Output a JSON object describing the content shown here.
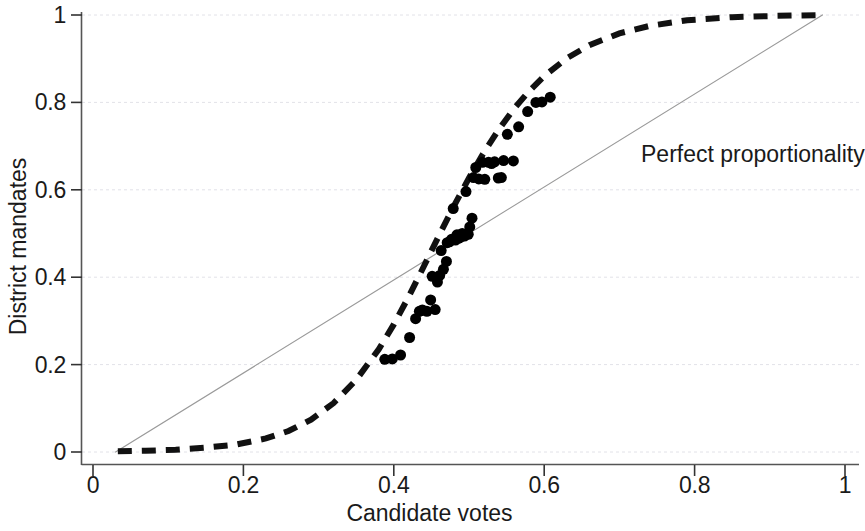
{
  "chart_data": {
    "type": "scatter",
    "title": "",
    "xlabel": "Candidate votes",
    "ylabel": "District mandates",
    "xlim": [
      0,
      1
    ],
    "ylim": [
      0,
      1
    ],
    "grid": true,
    "grid_axis": "y",
    "legend_position": "none",
    "x_ticks": [
      {
        "value": 0,
        "label": "0"
      },
      {
        "value": 0.2,
        "label": "0.2"
      },
      {
        "value": 0.4,
        "label": "0.4"
      },
      {
        "value": 0.6,
        "label": "0.6"
      },
      {
        "value": 0.8,
        "label": "0.8"
      },
      {
        "value": 1,
        "label": "1"
      }
    ],
    "y_ticks": [
      {
        "value": 0,
        "label": "0"
      },
      {
        "value": 0.2,
        "label": "0.2"
      },
      {
        "value": 0.4,
        "label": "0.4"
      },
      {
        "value": 0.6,
        "label": "0.6"
      },
      {
        "value": 0.8,
        "label": "0.8"
      },
      {
        "value": 1,
        "label": "1"
      }
    ],
    "annotations": [
      {
        "text": "Perfect proportionality",
        "x": 0.729,
        "y": 0.676,
        "target_series": "perfect-proportionality-line"
      }
    ],
    "series": [
      {
        "name": "Observed districts",
        "type": "scatter",
        "marker": "filled-circle",
        "color": "#000000",
        "marker_size_px": 11,
        "points": [
          [
            0.388,
            0.212
          ],
          [
            0.398,
            0.213
          ],
          [
            0.409,
            0.222
          ],
          [
            0.421,
            0.262
          ],
          [
            0.429,
            0.305
          ],
          [
            0.434,
            0.322
          ],
          [
            0.438,
            0.325
          ],
          [
            0.444,
            0.322
          ],
          [
            0.449,
            0.348
          ],
          [
            0.451,
            0.402
          ],
          [
            0.455,
            0.326
          ],
          [
            0.458,
            0.389
          ],
          [
            0.461,
            0.404
          ],
          [
            0.463,
            0.461
          ],
          [
            0.466,
            0.418
          ],
          [
            0.47,
            0.436
          ],
          [
            0.471,
            0.479
          ],
          [
            0.474,
            0.481
          ],
          [
            0.477,
            0.487
          ],
          [
            0.479,
            0.557
          ],
          [
            0.482,
            0.485
          ],
          [
            0.484,
            0.497
          ],
          [
            0.486,
            0.489
          ],
          [
            0.489,
            0.492
          ],
          [
            0.491,
            0.5
          ],
          [
            0.494,
            0.494
          ],
          [
            0.496,
            0.596
          ],
          [
            0.499,
            0.498
          ],
          [
            0.501,
            0.515
          ],
          [
            0.504,
            0.535
          ],
          [
            0.506,
            0.628
          ],
          [
            0.509,
            0.651
          ],
          [
            0.513,
            0.625
          ],
          [
            0.518,
            0.663
          ],
          [
            0.521,
            0.624
          ],
          [
            0.526,
            0.663
          ],
          [
            0.53,
            0.66
          ],
          [
            0.534,
            0.664
          ],
          [
            0.539,
            0.627
          ],
          [
            0.543,
            0.628
          ],
          [
            0.546,
            0.667
          ],
          [
            0.551,
            0.727
          ],
          [
            0.559,
            0.666
          ],
          [
            0.566,
            0.744
          ],
          [
            0.578,
            0.779
          ],
          [
            0.589,
            0.8
          ],
          [
            0.597,
            0.801
          ],
          [
            0.608,
            0.812
          ]
        ]
      },
      {
        "name": "Fitted seat-vote curve",
        "type": "line",
        "style": "dashed",
        "color": "#111111",
        "width_px": 6,
        "dash_pattern": "14 10",
        "description": "Logistic seat-vote (swing-ratio) curve",
        "points": [
          [
            0.033,
            0.002
          ],
          [
            0.07,
            0.003
          ],
          [
            0.11,
            0.005
          ],
          [
            0.15,
            0.01
          ],
          [
            0.19,
            0.017
          ],
          [
            0.23,
            0.031
          ],
          [
            0.26,
            0.048
          ],
          [
            0.29,
            0.074
          ],
          [
            0.32,
            0.112
          ],
          [
            0.35,
            0.165
          ],
          [
            0.38,
            0.235
          ],
          [
            0.4,
            0.292
          ],
          [
            0.42,
            0.356
          ],
          [
            0.44,
            0.425
          ],
          [
            0.46,
            0.495
          ],
          [
            0.48,
            0.563
          ],
          [
            0.5,
            0.627
          ],
          [
            0.52,
            0.686
          ],
          [
            0.54,
            0.739
          ],
          [
            0.56,
            0.786
          ],
          [
            0.58,
            0.826
          ],
          [
            0.6,
            0.86
          ],
          [
            0.63,
            0.901
          ],
          [
            0.66,
            0.931
          ],
          [
            0.7,
            0.958
          ],
          [
            0.74,
            0.975
          ],
          [
            0.79,
            0.988
          ],
          [
            0.85,
            0.995
          ],
          [
            0.91,
            0.998
          ],
          [
            0.97,
            1.0
          ]
        ]
      },
      {
        "name": "Perfect proportionality",
        "type": "line",
        "style": "solid",
        "color": "#9a9a9a",
        "width_px": 1.2,
        "points": [
          [
            0.03,
            0.0
          ],
          [
            0.97,
            1.0
          ]
        ]
      }
    ]
  },
  "axis": {
    "x_title": "Candidate votes",
    "y_title": "District mandates"
  }
}
